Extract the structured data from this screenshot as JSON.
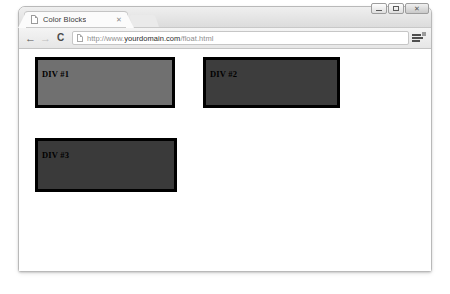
{
  "window": {
    "controls": [
      {
        "name": "minimize",
        "glyph": "–"
      },
      {
        "name": "maximize",
        "glyph": "□"
      },
      {
        "name": "close",
        "glyph": "✕"
      }
    ]
  },
  "tab": {
    "title": "Color Blocks",
    "close_label": "✕",
    "favicon": "page-icon"
  },
  "toolbar": {
    "back_label": "←",
    "forward_label": "→",
    "reload_label": "C",
    "menu_icon": "hamburger-menu-icon",
    "url_scheme": "http://www.",
    "url_host": "yourdomain.com",
    "url_path": "/float.html",
    "url_full": "http://www.yourdomain.com/float.html"
  },
  "page": {
    "blocks": [
      {
        "label": "DIV #1",
        "color": "#707070",
        "border_color": "#000000",
        "left": 16,
        "top": 8,
        "width": 140,
        "height": 51
      },
      {
        "label": "DIV #2",
        "color": "#3d3d3d",
        "border_color": "#000000",
        "left": 184,
        "top": 8,
        "width": 137,
        "height": 51
      },
      {
        "label": "DIV #3",
        "color": "#3a3a3a",
        "border_color": "#000000",
        "left": 16,
        "top": 89,
        "width": 142,
        "height": 54
      }
    ]
  }
}
